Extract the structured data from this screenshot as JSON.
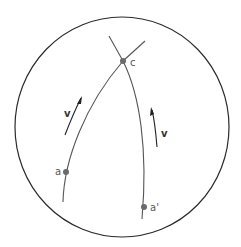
{
  "diagram": {
    "points": {
      "a": {
        "label": "a"
      },
      "a_prime": {
        "label": "a'"
      },
      "c": {
        "label": "c"
      }
    },
    "velocity_labels": {
      "left": "v",
      "right": "v"
    },
    "colors": {
      "stroke": "#2a2a2a",
      "point": "#6a6a6a",
      "label": "#555555",
      "background": "#ffffff"
    }
  }
}
